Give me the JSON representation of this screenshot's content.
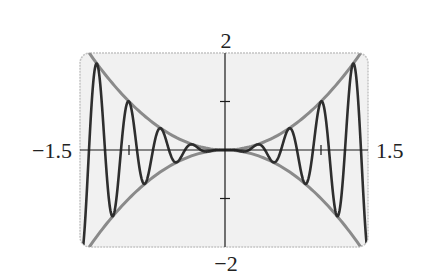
{
  "chart_data": {
    "type": "line",
    "title": "",
    "xlabel": "",
    "ylabel": "",
    "xlim": [
      -1.5,
      1.5
    ],
    "ylim": [
      -2,
      2
    ],
    "grid": false,
    "legend": null,
    "axis_labels": {
      "x_min": "−1.5",
      "x_max": "1.5",
      "y_max": "2",
      "y_min": "−2"
    },
    "x_ticks": [
      -1,
      1
    ],
    "y_ticks": [
      -1,
      1
    ],
    "series": [
      {
        "name": "y = x^2",
        "role": "upper envelope",
        "formula": "x^2",
        "color": "#8a8a8a",
        "samples": 120
      },
      {
        "name": "y = -x^2",
        "role": "lower envelope",
        "formula": "-x^2",
        "color": "#8a8a8a",
        "samples": 120
      },
      {
        "name": "y = x^2 cos(6πx)",
        "role": "oscillating curve",
        "formula": "x^2*cos(6*pi*x)",
        "color": "#2e2e2e",
        "samples": 900
      }
    ],
    "sample_points": {
      "x": [
        -1.5,
        -1.333,
        -1.167,
        -1.0,
        -0.833,
        -0.667,
        -0.5,
        -0.333,
        -0.167,
        0,
        0.167,
        0.333,
        0.5,
        0.667,
        0.833,
        1.0,
        1.167,
        1.333,
        1.5
      ],
      "envelope_upper": [
        2.25,
        1.78,
        1.36,
        1.0,
        0.69,
        0.44,
        0.25,
        0.11,
        0.03,
        0,
        0.03,
        0.11,
        0.25,
        0.44,
        0.69,
        1.0,
        1.36,
        1.78,
        2.25
      ],
      "oscillating": [
        -2.25,
        1.78,
        -1.36,
        1.0,
        -0.69,
        0.44,
        -0.25,
        0.11,
        -0.03,
        0,
        -0.03,
        0.11,
        -0.25,
        0.44,
        -0.69,
        1.0,
        -1.36,
        1.78,
        -2.25
      ]
    }
  },
  "style": {
    "plot_background": "#f1f1f1",
    "frame_color": "#c4c4c4",
    "axis_color": "#1a1a1a",
    "envelope_color": "#8a8a8a",
    "curve_color": "#2e2e2e"
  }
}
